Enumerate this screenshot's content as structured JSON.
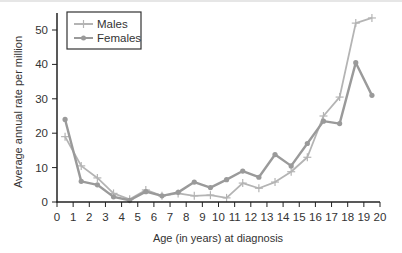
{
  "chart_data": {
    "type": "line",
    "title": "",
    "xlabel": "Age (in years) at diagnosis",
    "ylabel": "Average annual rate per million",
    "xlim": [
      0,
      20
    ],
    "ylim": [
      0,
      55
    ],
    "x_ticks": [
      0,
      1,
      2,
      3,
      4,
      5,
      6,
      7,
      8,
      9,
      10,
      11,
      12,
      13,
      14,
      15,
      16,
      17,
      18,
      19,
      20
    ],
    "y_ticks": [
      0,
      10,
      20,
      30,
      40,
      50
    ],
    "grid": false,
    "legend_position": "upper left",
    "x": [
      0.5,
      1.5,
      2.5,
      3.5,
      4.5,
      5.5,
      6.5,
      7.5,
      8.5,
      9.5,
      10.5,
      11.5,
      12.5,
      13.5,
      14.5,
      15.5,
      16.5,
      17.5,
      18.5,
      19.5
    ],
    "series": [
      {
        "name": "Males",
        "marker": "plus",
        "color": "#b4b4b4",
        "values": [
          19,
          10.5,
          7,
          2.5,
          0.8,
          3.5,
          1.8,
          2.5,
          1.8,
          2,
          1.2,
          5.5,
          4,
          5.8,
          8.8,
          13,
          25,
          30.5,
          52,
          53.5
        ]
      },
      {
        "name": "Females",
        "marker": "circle",
        "color": "#9a9a9a",
        "values": [
          24,
          6,
          5,
          1.5,
          0.5,
          3,
          1.8,
          2.8,
          5.8,
          4.2,
          6.5,
          9,
          7.2,
          13.8,
          10.5,
          17,
          23.5,
          22.8,
          40.5,
          31
        ]
      }
    ]
  },
  "legend": {
    "males_label": "Males",
    "females_label": "Females"
  },
  "axes": {
    "xlabel": "Age (in years) at diagnosis",
    "ylabel": "Average annual rate per million"
  }
}
